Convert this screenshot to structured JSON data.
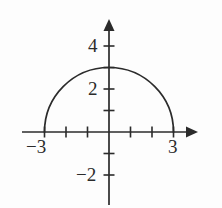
{
  "figure": {
    "name": "semicircle-graph",
    "background_color": "#fdfdfd",
    "stroke_color": "#2b2b2b",
    "label_color": "#2b2b2b"
  },
  "axes": {
    "x_axis_label": "",
    "y_axis_label": "",
    "origin_px": {
      "x": 109,
      "y": 132
    },
    "unit_px": 21.5,
    "x_ticks": [
      -3,
      -2,
      -1,
      1,
      2,
      3
    ],
    "y_ticks": [
      1,
      2,
      3,
      4,
      -1,
      -2
    ],
    "x_tick_labels": [
      {
        "value": -3,
        "text": "−3"
      },
      {
        "value": 3,
        "text": "3"
      }
    ],
    "y_tick_labels": [
      {
        "value": 4,
        "text": "4"
      },
      {
        "value": 2,
        "text": "2"
      },
      {
        "value": -2,
        "text": "−2"
      }
    ],
    "x_range": [
      -4.0,
      4.0
    ],
    "y_range": [
      -3.5,
      5.4
    ],
    "grid": false
  },
  "chart_data": {
    "type": "line",
    "title": "",
    "xlabel": "",
    "ylabel": "",
    "xlim": [
      -4.0,
      4.0
    ],
    "ylim": [
      -3.5,
      5.4
    ],
    "grid": false,
    "legend": null,
    "series": [
      {
        "name": "upper semicircle y = sqrt(9 - x^2)",
        "equation": "y = √(9 − x²)",
        "shape": "semicircle",
        "center": [
          0,
          0
        ],
        "radius": 3,
        "domain": [
          -3,
          3
        ],
        "range": [
          0,
          3
        ],
        "x": [
          -3,
          -2.75,
          -2.5,
          -2.25,
          -2,
          -1.75,
          -1.5,
          -1.25,
          -1,
          -0.75,
          -0.5,
          -0.25,
          0,
          0.25,
          0.5,
          0.75,
          1,
          1.25,
          1.5,
          1.75,
          2,
          2.25,
          2.5,
          2.75,
          3
        ],
        "values": [
          0,
          1.198,
          1.658,
          1.984,
          2.236,
          2.437,
          2.598,
          2.727,
          2.828,
          2.905,
          2.958,
          2.99,
          3,
          2.99,
          2.958,
          2.905,
          2.828,
          2.727,
          2.598,
          2.437,
          2.236,
          1.984,
          1.658,
          1.198,
          0
        ]
      }
    ],
    "annotations": [
      {
        "text": "−3",
        "x": -3,
        "y": 0,
        "position": "below-axis"
      },
      {
        "text": "3",
        "x": 3,
        "y": 0,
        "position": "below-axis"
      },
      {
        "text": "4",
        "x": 0,
        "y": 4,
        "position": "left-of-axis"
      },
      {
        "text": "2",
        "x": 0,
        "y": 2,
        "position": "left-of-axis"
      },
      {
        "text": "−2",
        "x": 0,
        "y": -2,
        "position": "left-of-axis"
      }
    ]
  },
  "labels": {
    "x_neg3": "−3",
    "x_pos3": "3",
    "y_4": "4",
    "y_2": "2",
    "y_neg2": "−2"
  }
}
